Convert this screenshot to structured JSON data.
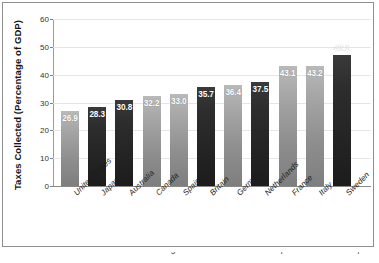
{
  "chart_data": {
    "type": "bar",
    "title": "",
    "xlabel": "",
    "ylabel": "Taxes Collected (Percentage of GDP)",
    "ylim": [
      0,
      60
    ],
    "yticks": [
      0,
      10,
      20,
      30,
      40,
      50,
      60
    ],
    "grid": true,
    "legend": false,
    "categories": [
      "United States",
      "Japan",
      "Australia",
      "Canada",
      "Spain",
      "Britain",
      "Germany",
      "Netherlands",
      "France",
      "Italy",
      "Sweden"
    ],
    "values": [
      26.9,
      28.3,
      30.8,
      32.2,
      33.0,
      35.7,
      36.4,
      37.5,
      43.1,
      43.2,
      47.1
    ],
    "value_labels": [
      "26.9",
      "28.3",
      "30.8",
      "32.2",
      "33.0",
      "35.7",
      "36.4",
      "37.5",
      "43.1",
      "43.2",
      "47.1"
    ],
    "bar_shades": [
      "light",
      "dark",
      "dark",
      "light",
      "light",
      "dark",
      "light",
      "dark",
      "light",
      "light",
      "dark"
    ],
    "label_placement": [
      "inside",
      "inside",
      "inside",
      "inside",
      "inside",
      "inside",
      "inside",
      "inside",
      "inside",
      "inside",
      "outside"
    ],
    "colors": {
      "bar_light": "#a8a8a8",
      "bar_dark": "#2d2d2d",
      "gridline": "#e6e6e6",
      "axis": "#8a8a8a",
      "value_label": "#ffffff",
      "frame": "#8e8e8e"
    }
  },
  "caption": {
    "text": "Source: Economic data derived from the Organization for Economic Cooperation and Development"
  }
}
